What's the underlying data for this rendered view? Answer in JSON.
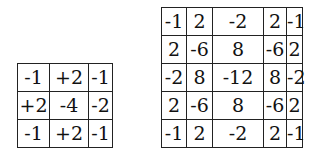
{
  "kernels": [
    {
      "name": "laplacian-3x3",
      "col_widths": [
        32,
        39,
        24
      ],
      "rows": [
        [
          "-1",
          "+2",
          "-1"
        ],
        [
          "+2",
          "-4",
          "-2"
        ],
        [
          "-1",
          "+2",
          "-1"
        ]
      ]
    },
    {
      "name": "kernel-5x5",
      "col_widths": [
        25,
        26,
        51,
        23,
        16
      ],
      "rows": [
        [
          "-1",
          "2",
          "-2",
          "2",
          "-1"
        ],
        [
          "2",
          "-6",
          "8",
          "-6",
          "2"
        ],
        [
          "-2",
          "8",
          "-12",
          "8",
          "-2"
        ],
        [
          "2",
          "-6",
          "8",
          "-6",
          "2"
        ],
        [
          "-1",
          "2",
          "-2",
          "2",
          "-1"
        ]
      ]
    }
  ]
}
